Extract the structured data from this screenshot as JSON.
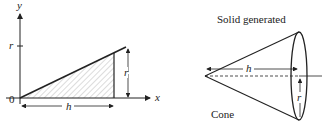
{
  "left_diagram": {
    "axis_x_label": "x",
    "axis_y_label": "y",
    "origin_label": "0",
    "tick_label_r": "r",
    "height_dim_label": "r",
    "width_dim_label": "h"
  },
  "right_diagram": {
    "title": "Solid generated",
    "shape_label": "Cone",
    "height_dim_label": "h",
    "radius_dim_label": "r"
  },
  "colors": {
    "ink": "#222222",
    "hatch": "#888888"
  }
}
